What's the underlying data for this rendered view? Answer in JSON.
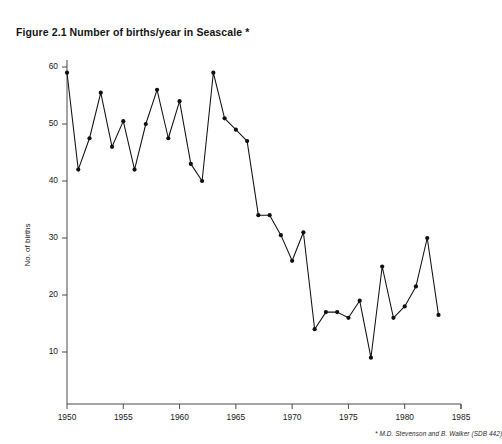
{
  "figure": {
    "title": "Figure 2.1 Number of births/year in Seascale *",
    "footnote": "* M.D. Stevenson and B. Walker (SDB 442)"
  },
  "chart_data": {
    "type": "line",
    "title": "Figure 2.1 Number of births/year in Seascale *",
    "xlabel": "",
    "ylabel": "No. of births",
    "xlim": [
      1949,
      1985
    ],
    "ylim": [
      0,
      62
    ],
    "xticks": [
      1950,
      1955,
      1960,
      1965,
      1970,
      1975,
      1980,
      1985
    ],
    "yticks": [
      10,
      20,
      30,
      40,
      50,
      60
    ],
    "grid": false,
    "legend": false,
    "markers": "filled-circle",
    "x": [
      1950,
      1951,
      1952,
      1953,
      1954,
      1955,
      1956,
      1957,
      1958,
      1959,
      1960,
      1961,
      1962,
      1963,
      1964,
      1965,
      1966,
      1967,
      1968,
      1969,
      1970,
      1971,
      1972,
      1973,
      1974,
      1975,
      1976,
      1977,
      1978,
      1979,
      1980,
      1981,
      1982,
      1983
    ],
    "values": [
      59,
      42,
      47.5,
      55.5,
      46,
      50.5,
      42,
      50,
      56,
      47.5,
      54,
      43,
      40,
      59,
      51,
      49,
      47,
      34,
      34,
      30.5,
      26,
      31,
      14,
      17,
      17,
      16,
      19,
      9,
      25,
      16,
      18,
      21.5,
      30,
      16.5
    ],
    "series": [
      {
        "name": "No. of births",
        "values": [
          59,
          42,
          47.5,
          55.5,
          46,
          50.5,
          42,
          50,
          56,
          47.5,
          54,
          43,
          40,
          59,
          51,
          49,
          47,
          34,
          34,
          30.5,
          26,
          31,
          14,
          17,
          17,
          16,
          19,
          9,
          25,
          16,
          18,
          21.5,
          30,
          16.5
        ]
      }
    ],
    "colors": {
      "line": "#111111",
      "marker": "#101010",
      "axis": "#4a4a4a",
      "background": "#ffffff"
    }
  }
}
